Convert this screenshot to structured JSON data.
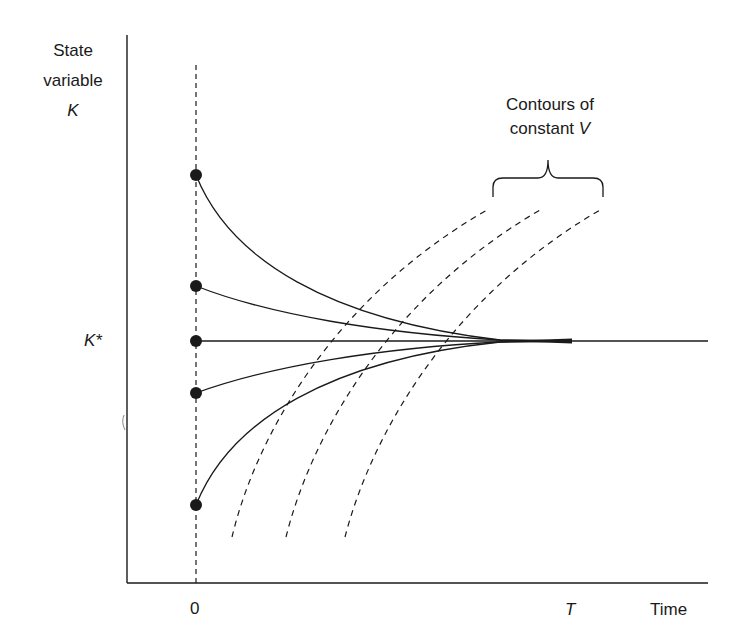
{
  "diagram": {
    "type": "phase-diagram",
    "y_axis": {
      "label_line1": "State",
      "label_line2": "variable",
      "label_symbol": "K"
    },
    "x_axis": {
      "label": "Time",
      "tick_zero": "0",
      "tick_T": "T"
    },
    "steady_state_label": "K*",
    "annotation": {
      "line1": "Contours of",
      "line2_prefix": "constant ",
      "line2_symbol": "V"
    },
    "initial_points": [
      {
        "name": "start-high",
        "y": 175
      },
      {
        "name": "start-mid-high",
        "y": 286
      },
      {
        "name": "start-steady",
        "y": 341
      },
      {
        "name": "start-mid-low",
        "y": 393
      },
      {
        "name": "start-low",
        "y": 505
      }
    ],
    "contour_count": 3,
    "colors": {
      "ink": "#1a1a1a",
      "background": "#ffffff"
    }
  }
}
